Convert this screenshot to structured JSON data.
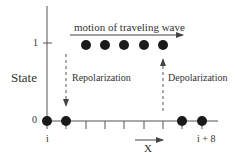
{
  "diagram": {
    "y_axis_label": "State",
    "y_ticks": [
      {
        "label": "1",
        "value": 1
      },
      {
        "label": "0",
        "value": 0
      }
    ],
    "x_axis_label": "X",
    "x_tick_labels": {
      "start": "i",
      "end": "i + 8"
    },
    "wave_label": "motion of traveling wave",
    "left_annotation": "Repolarization",
    "right_annotation": "Depolarization",
    "cells": [
      {
        "index": "i",
        "state": 0
      },
      {
        "index": "i+1",
        "state": 0
      },
      {
        "index": "i+2",
        "state": 1
      },
      {
        "index": "i+3",
        "state": 1
      },
      {
        "index": "i+4",
        "state": 1
      },
      {
        "index": "i+5",
        "state": 1
      },
      {
        "index": "i+6",
        "state": 1
      },
      {
        "index": "i+7",
        "state": 0
      },
      {
        "index": "i+8",
        "state": 0
      }
    ]
  }
}
